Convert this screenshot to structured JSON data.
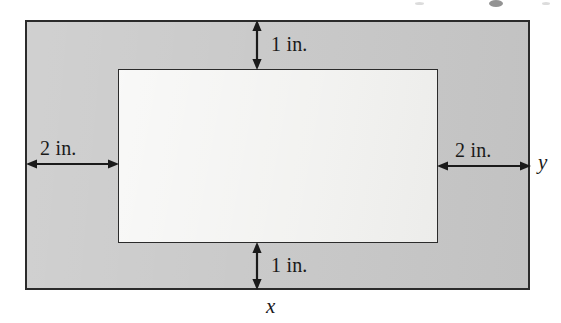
{
  "figure": {
    "page_width_label": "x",
    "page_height_label": "y",
    "colors": {
      "margin_fill": "#c9c9c9",
      "print_area_fill": "#f1f1ef",
      "stroke": "#2b2b2b",
      "background": "#ffffff"
    }
  },
  "dimensions": {
    "top_margin": {
      "label": "1 in.",
      "value": 1,
      "unit": "in.",
      "position": "top"
    },
    "bottom_margin": {
      "label": "1 in.",
      "value": 1,
      "unit": "in.",
      "position": "bottom"
    },
    "left_margin": {
      "label": "2 in.",
      "value": 2,
      "unit": "in.",
      "position": "left"
    },
    "right_margin": {
      "label": "2 in.",
      "value": 2,
      "unit": "in.",
      "position": "right"
    }
  },
  "variables": {
    "width": {
      "label": "x",
      "meaning": "total page width",
      "position": "below-bottom-edge"
    },
    "height": {
      "label": "y",
      "meaning": "total page height",
      "position": "right-of-right-edge"
    }
  }
}
